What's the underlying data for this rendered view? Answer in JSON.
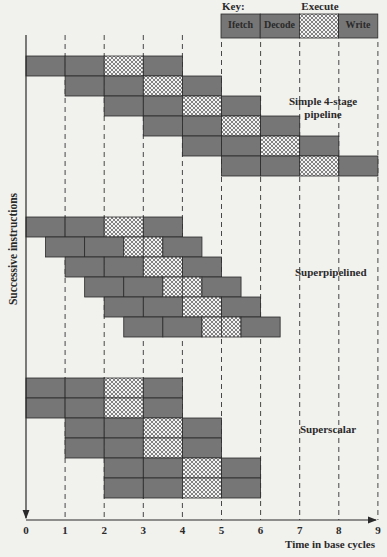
{
  "key": {
    "title": "Key:",
    "execute_label": "Execute",
    "cells": [
      "Ifetch",
      "Decode",
      "",
      "Write"
    ]
  },
  "axes": {
    "y_label": "Successive instructions",
    "x_label": "Time in base cycles",
    "x_ticks": [
      "0",
      "1",
      "2",
      "3",
      "4",
      "5",
      "6",
      "7",
      "8",
      "9"
    ]
  },
  "sections": [
    {
      "label_line1": "Simple 4-stage",
      "label_line2": "pipeline",
      "rows": [
        {
          "start": 0,
          "stage": 1,
          "split": false
        },
        {
          "start": 1,
          "stage": 1,
          "split": false
        },
        {
          "start": 2,
          "stage": 1,
          "split": false
        },
        {
          "start": 3,
          "stage": 1,
          "split": false
        },
        {
          "start": 4,
          "stage": 1,
          "split": false
        },
        {
          "start": 5,
          "stage": 1,
          "split": false
        }
      ]
    },
    {
      "label_line1": "Superpipelined",
      "label_line2": "",
      "rows": [
        {
          "start": 0,
          "stage": 1,
          "split": false
        },
        {
          "start": 0.5,
          "stage": 1,
          "split": true
        },
        {
          "start": 1,
          "stage": 1,
          "split": false
        },
        {
          "start": 1.5,
          "stage": 1,
          "split": true
        },
        {
          "start": 2,
          "stage": 1,
          "split": false
        },
        {
          "start": 2.5,
          "stage": 1,
          "split": true
        }
      ]
    },
    {
      "label_line1": "Superscalar",
      "label_line2": "",
      "rows": [
        {
          "start": 0,
          "stage": 1,
          "split": false
        },
        {
          "start": 0,
          "stage": 1,
          "split": false
        },
        {
          "start": 1,
          "stage": 1,
          "split": false
        },
        {
          "start": 1,
          "stage": 1,
          "split": false
        },
        {
          "start": 2,
          "stage": 1,
          "split": false
        },
        {
          "start": 2,
          "stage": 1,
          "split": false
        }
      ]
    }
  ],
  "colors": {
    "bar": "#767676",
    "background": "#f1f1ee",
    "line": "#2a2a2a"
  }
}
